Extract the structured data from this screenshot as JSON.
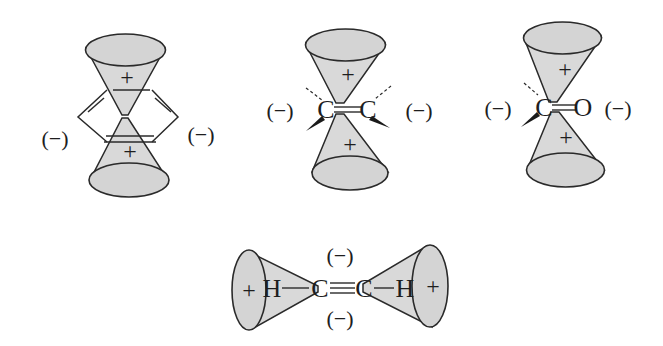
{
  "figure": {
    "colors": {
      "cone_fill": "#d9d9d9",
      "stroke": "#2a2a2a",
      "background": "#ffffff"
    },
    "benzene": {
      "top_sign": "+",
      "bottom_sign": "+",
      "left_sign": "(−)",
      "right_sign": "(−)"
    },
    "alkene": {
      "top_sign": "+",
      "bottom_sign": "+",
      "left_sign": "(−)",
      "right_sign": "(−)",
      "atom_left": "C",
      "atom_right": "C"
    },
    "carbonyl": {
      "top_sign": "+",
      "bottom_sign": "+",
      "left_sign": "(−)",
      "right_sign": "(−)",
      "atom_left": "C",
      "atom_right": "O"
    },
    "alkyne": {
      "left_sign": "+",
      "right_sign": "+",
      "top_sign": "(−)",
      "bottom_sign": "(−)",
      "h_left": "H",
      "c_left": "C",
      "c_right": "C",
      "h_right": "H"
    }
  }
}
